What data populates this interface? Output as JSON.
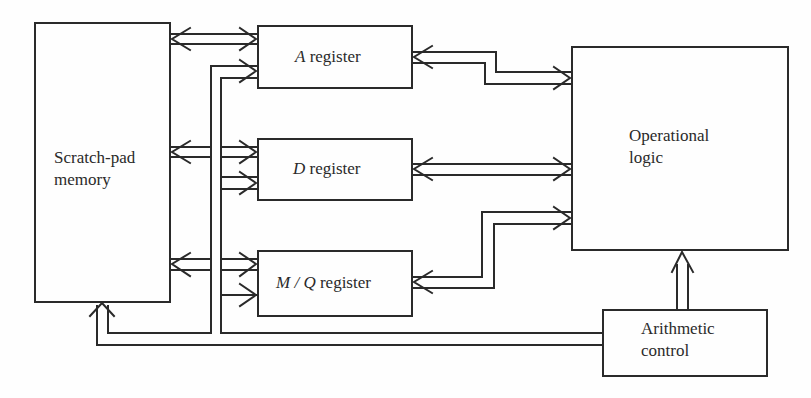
{
  "diagram": {
    "type": "block-diagram",
    "colors": {
      "stroke": "#2a2a2a",
      "background": "#fefefe",
      "text": "#2a2a2a"
    },
    "blocks": [
      {
        "id": "scratch-pad-memory",
        "line1": "Scratch-pad",
        "line2": "memory"
      },
      {
        "id": "a-register",
        "var": "A",
        "suffix": " register"
      },
      {
        "id": "d-register",
        "var": "D",
        "suffix": " register"
      },
      {
        "id": "mq-register",
        "var": "M / Q",
        "suffix": " register"
      },
      {
        "id": "operational-logic",
        "line1": "Operational",
        "line2": "logic"
      },
      {
        "id": "arithmetic-control",
        "line1": "Arithmetic",
        "line2": "control"
      }
    ],
    "connections": [
      {
        "from": "scratch-pad-memory",
        "to": "a-register",
        "kind": "bidirectional-bus"
      },
      {
        "from": "scratch-pad-memory",
        "to": "d-register",
        "kind": "bidirectional-bus"
      },
      {
        "from": "scratch-pad-memory",
        "to": "mq-register",
        "kind": "bidirectional-bus"
      },
      {
        "from": "a-register",
        "to": "operational-logic",
        "kind": "bidirectional-bus"
      },
      {
        "from": "d-register",
        "to": "operational-logic",
        "kind": "bidirectional-bus"
      },
      {
        "from": "mq-register",
        "to": "operational-logic",
        "kind": "bidirectional-bus"
      },
      {
        "from": "arithmetic-control",
        "to": "operational-logic",
        "kind": "unidirectional-bus"
      },
      {
        "from": "arithmetic-control",
        "to": "scratch-pad-memory",
        "kind": "control-line"
      },
      {
        "from": "arithmetic-control",
        "to": [
          "a-register",
          "d-register",
          "mq-register"
        ],
        "kind": "control-line"
      }
    ]
  }
}
